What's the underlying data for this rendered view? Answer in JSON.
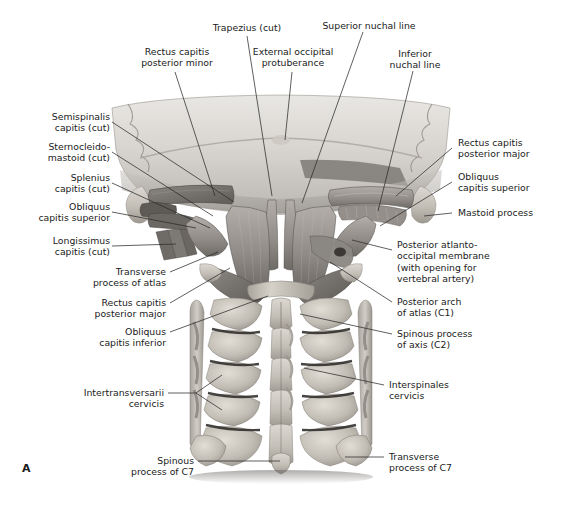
{
  "figure": {
    "letter": "A",
    "view": "Posterior view of the suboccipital region and cervical spine",
    "background_color": "#ffffff",
    "leader_line_color": "#2b2b2b",
    "text_color": "#1a1a1a"
  },
  "labels": {
    "trapezius_cut": "Trapezius (cut)",
    "superior_nuchal_line": "Superior nuchal line",
    "rectus_capitis_posterior_minor": "Rectus capitis\nposterior minor",
    "external_occipital_protuberance": "External occipital\nprotuberance",
    "inferior_nuchal_line": "Inferior\nnuchal line",
    "semispinalis_capitis_cut": "Semispinalis\ncapitis (cut)",
    "sternocleidomastoid_cut": "Sternocleido-\nmastoid (cut)",
    "splenius_capitis_cut": "Splenius\ncapitis (cut)",
    "obliquus_capitis_superior_left": "Obliquus\ncapitis superior",
    "longissimus_capitis_cut": "Longissimus\ncapitis (cut)",
    "rectus_capitis_posterior_major_right": "Rectus capitis\nposterior major",
    "obliquus_capitis_superior_right": "Obliquus\ncapitis superior",
    "mastoid_process": "Mastoid process",
    "posterior_atlantooccipital_membrane": "Posterior atlanto-\noccipital membrane\n(with opening for\nvertebral artery)",
    "posterior_arch_of_atlas": "Posterior arch\nof atlas (C1)",
    "spinous_process_of_axis": "Spinous process\nof axis (C2)",
    "transverse_process_of_atlas": "Transverse\nprocess of atlas",
    "rectus_capitis_posterior_major_left": "Rectus capitis\nposterior major",
    "obliquus_capitis_inferior": "Obliquus\ncapitis inferior",
    "intertransversarii_cervicis": "Intertransversarii\ncervicis",
    "interspinales_cervicis": "Interspinales\ncervicis",
    "spinous_process_of_c7": "Spinous\nprocess of C7",
    "transverse_process_of_c7": "Transverse\nprocess of C7"
  }
}
